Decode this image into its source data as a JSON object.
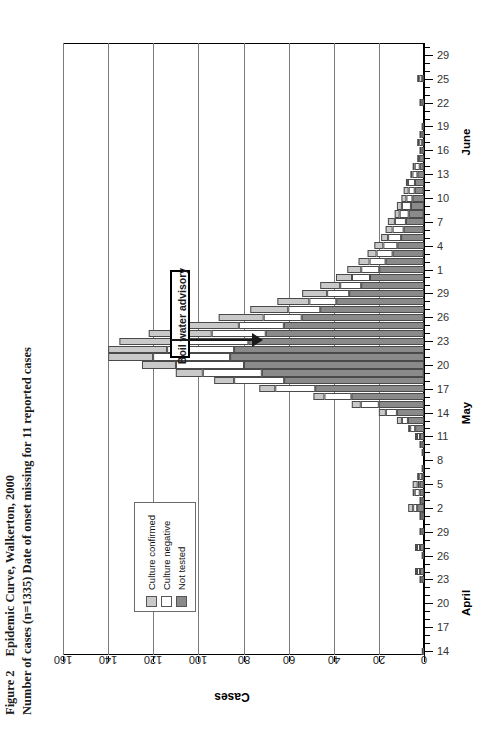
{
  "figure": {
    "label": "Figure 2",
    "title_line1": "Epidemic Curve, Walkerton, 2000",
    "title_line2": "Number of cases (n=1335) Date of onset missing for 11 reported cases"
  },
  "legend": {
    "items": [
      {
        "label": "Culture confirmed",
        "color": "#c9c9c9"
      },
      {
        "label": "Culture negative",
        "color": "#ffffff"
      },
      {
        "label": "Not tested",
        "color": "#8a8a8a"
      }
    ]
  },
  "annotation": {
    "boil_water_advisory": "Boil water advisory"
  },
  "axes": {
    "value_axis_title": "Cases",
    "value_ticks": [
      "0",
      "20",
      "40",
      "60",
      "80",
      "100",
      "120",
      "140",
      "160"
    ],
    "month_labels": [
      "April",
      "May",
      "June"
    ],
    "date_ticks": [
      "14",
      "17",
      "20",
      "23",
      "26",
      "29",
      "2",
      "5",
      "8",
      "11",
      "14",
      "17",
      "20",
      "23",
      "26",
      "29",
      "1",
      "4",
      "7",
      "10",
      "13",
      "16",
      "19",
      "22",
      "25",
      "29"
    ]
  },
  "chart_data": {
    "type": "bar",
    "orientation": "horizontal",
    "stacked": true,
    "title": "Epidemic Curve, Walkerton, 2000",
    "subtitle": "Number of cases (n=1335) Date of onset missing for 11 reported cases",
    "xlabel": "Cases",
    "ylabel": "",
    "xlim": [
      0,
      160
    ],
    "grid": true,
    "legend_position": "inside-left",
    "series": [
      {
        "name": "Culture confirmed",
        "color": "#c9c9c9"
      },
      {
        "name": "Culture negative",
        "color": "#ffffff"
      },
      {
        "name": "Not tested",
        "color": "#8a8a8a"
      }
    ],
    "categories": [
      "Apr 14",
      "Apr 15",
      "Apr 16",
      "Apr 17",
      "Apr 18",
      "Apr 19",
      "Apr 20",
      "Apr 21",
      "Apr 22",
      "Apr 23",
      "Apr 24",
      "Apr 25",
      "Apr 26",
      "Apr 27",
      "Apr 28",
      "Apr 29",
      "Apr 30",
      "May 1",
      "May 2",
      "May 3",
      "May 4",
      "May 5",
      "May 6",
      "May 7",
      "May 8",
      "May 9",
      "May 10",
      "May 11",
      "May 12",
      "May 13",
      "May 14",
      "May 15",
      "May 16",
      "May 17",
      "May 18",
      "May 19",
      "May 20",
      "May 21",
      "May 22",
      "May 23",
      "May 24",
      "May 25",
      "May 26",
      "May 27",
      "May 28",
      "May 29",
      "May 30",
      "May 31",
      "Jun 1",
      "Jun 2",
      "Jun 3",
      "Jun 4",
      "Jun 5",
      "Jun 6",
      "Jun 7",
      "Jun 8",
      "Jun 9",
      "Jun 10",
      "Jun 11",
      "Jun 12",
      "Jun 13",
      "Jun 14",
      "Jun 15",
      "Jun 16",
      "Jun 17",
      "Jun 18",
      "Jun 19",
      "Jun 20",
      "Jun 21",
      "Jun 22",
      "Jun 23",
      "Jun 24",
      "Jun 25",
      "Jun 26",
      "Jun 27",
      "Jun 28",
      "Jun 29"
    ],
    "values": {
      "Culture confirmed": [
        0,
        0,
        0,
        0,
        0,
        0,
        0,
        0,
        0,
        0,
        1,
        0,
        0,
        1,
        0,
        0,
        0,
        0,
        2,
        0,
        1,
        2,
        1,
        0,
        0,
        0,
        0,
        1,
        1,
        2,
        3,
        4,
        5,
        7,
        9,
        12,
        15,
        20,
        26,
        30,
        28,
        24,
        20,
        17,
        14,
        11,
        9,
        7,
        6,
        5,
        4,
        4,
        3,
        3,
        3,
        2,
        2,
        2,
        2,
        1,
        1,
        1,
        0,
        0,
        1,
        0,
        0,
        0,
        0,
        0,
        0,
        0,
        1,
        0,
        0,
        0,
        0
      ],
      "Culture negative": [
        1,
        0,
        0,
        0,
        0,
        0,
        0,
        0,
        0,
        1,
        1,
        0,
        0,
        1,
        0,
        1,
        0,
        1,
        2,
        1,
        2,
        1,
        1,
        0,
        0,
        0,
        1,
        1,
        2,
        3,
        5,
        8,
        12,
        18,
        22,
        26,
        30,
        34,
        30,
        27,
        24,
        20,
        17,
        14,
        12,
        10,
        9,
        8,
        8,
        7,
        7,
        6,
        6,
        5,
        5,
        4,
        4,
        3,
        3,
        3,
        2,
        2,
        1,
        1,
        1,
        1,
        0,
        0,
        0,
        1,
        0,
        0,
        1,
        0,
        0,
        0,
        0
      ],
      "Not tested": [
        0,
        0,
        0,
        0,
        0,
        0,
        0,
        0,
        0,
        1,
        2,
        0,
        1,
        2,
        0,
        1,
        0,
        1,
        3,
        1,
        2,
        2,
        1,
        1,
        0,
        1,
        1,
        2,
        4,
        7,
        12,
        20,
        32,
        48,
        62,
        72,
        80,
        86,
        84,
        78,
        70,
        62,
        54,
        46,
        39,
        33,
        28,
        24,
        20,
        17,
        14,
        12,
        10,
        9,
        8,
        7,
        6,
        5,
        4,
        4,
        3,
        2,
        2,
        1,
        1,
        1,
        1,
        0,
        0,
        1,
        0,
        0,
        1,
        0,
        0,
        0,
        0
      ]
    },
    "totals": [
      1,
      0,
      0,
      0,
      0,
      0,
      0,
      0,
      0,
      2,
      4,
      0,
      1,
      4,
      0,
      2,
      0,
      2,
      7,
      2,
      5,
      5,
      3,
      1,
      0,
      1,
      2,
      4,
      7,
      12,
      20,
      32,
      49,
      73,
      93,
      110,
      125,
      140,
      140,
      135,
      122,
      106,
      91,
      77,
      65,
      54,
      46,
      39,
      34,
      29,
      25,
      22,
      19,
      17,
      16,
      13,
      12,
      10,
      9,
      8,
      6,
      5,
      3,
      2,
      3,
      2,
      1,
      0,
      0,
      2,
      0,
      0,
      3,
      0,
      0,
      0,
      0
    ]
  }
}
